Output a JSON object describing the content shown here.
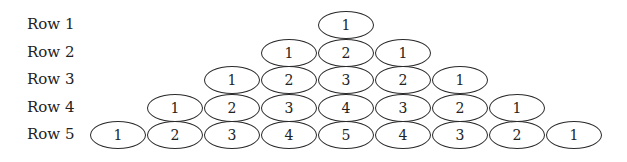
{
  "rows": [
    {
      "label": "Row 1",
      "values": [
        1
      ]
    },
    {
      "label": "Row 2",
      "values": [
        1,
        2,
        1
      ]
    },
    {
      "label": "Row 3",
      "values": [
        1,
        2,
        3,
        2,
        1
      ]
    },
    {
      "label": "Row 4",
      "values": [
        1,
        2,
        3,
        4,
        3,
        2,
        1
      ]
    },
    {
      "label": "Row 5",
      "values": [
        1,
        2,
        3,
        4,
        5,
        4,
        3,
        2,
        1
      ]
    }
  ]
}
